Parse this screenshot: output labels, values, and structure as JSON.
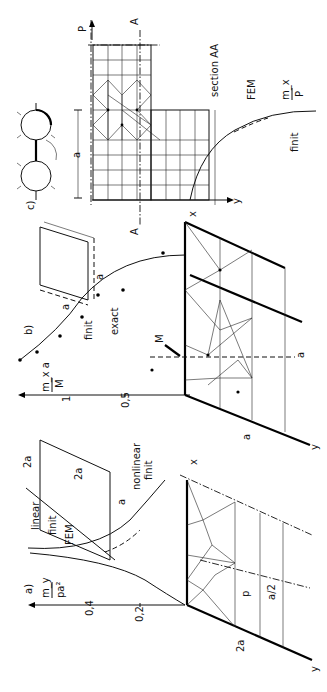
{
  "figure": {
    "orientation": "rotated 90deg counter-clockwise",
    "panels": {
      "a": {
        "label": "a)",
        "y_axis_label_num": "m_y",
        "y_axis_label_den": "pa²",
        "ticks": [
          "0,2",
          "0,4"
        ],
        "curve_labels": [
          "linear",
          "finit",
          "FEM",
          "nonlinear",
          "finit"
        ],
        "dimensions": [
          "2a",
          "2a",
          "a",
          "a/2",
          "2a"
        ],
        "load_label": "p",
        "axis_x": "x",
        "axis_y": "y"
      },
      "b": {
        "label": "b)",
        "y_axis_label_num": "m_x a",
        "y_axis_label_den": "M",
        "ticks": [
          "0,5",
          "1"
        ],
        "curve_labels": [
          "finit",
          "exact"
        ],
        "dimensions": [
          "a",
          "a",
          "a",
          "a"
        ],
        "load_label": "M",
        "axis_x": "x",
        "axis_y": "y"
      },
      "c": {
        "label": "c)",
        "y_axis_label_num": "m_x",
        "y_axis_label_den": "P",
        "curve_labels": [
          "FEM",
          "finit"
        ],
        "section_label": "section AA",
        "section_marks": [
          "A",
          "A"
        ],
        "dimensions": [
          "a"
        ],
        "load_label": "P",
        "axis_x": "x",
        "axis_y": "y"
      }
    }
  }
}
